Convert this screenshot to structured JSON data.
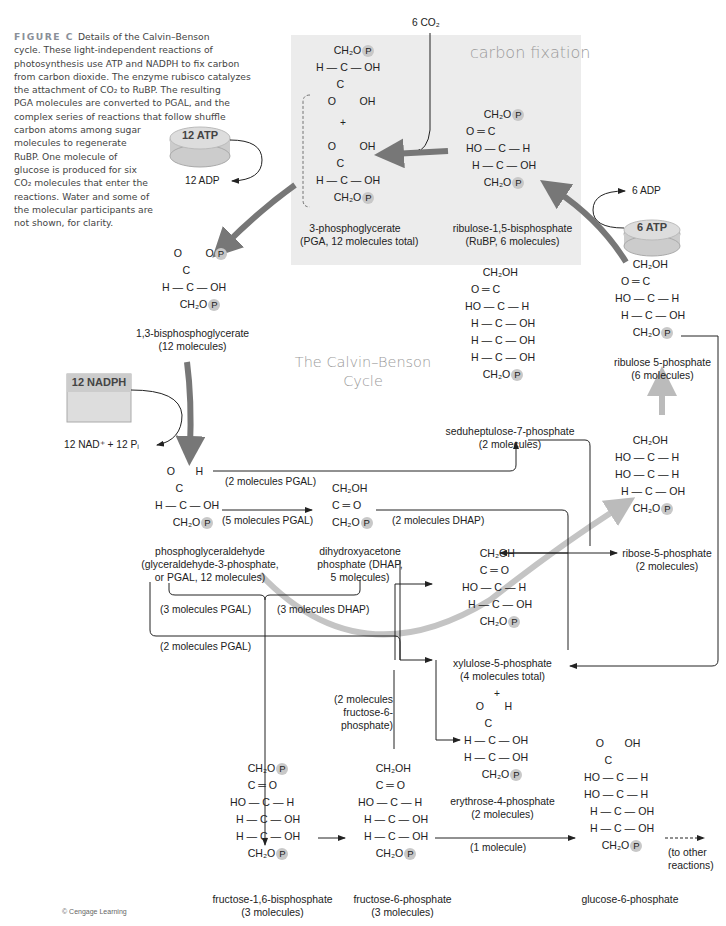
{
  "caption": {
    "figure_label": "FIGURE C",
    "lines": [
      "Details of the Calvin–Benson",
      "cycle. These light-independent reactions of",
      "photosynthesis use ATP and NADPH to fix carbon",
      "from carbon dioxide. The enzyme rubisco catalyzes",
      "the attachment of CO₂ to RuBP. The resulting",
      "PGA molecules are converted to PGAL, and the",
      "complex series of reactions that follow shuffle",
      "carbon atoms among sugar",
      "molecules to regenerate",
      "RuBP. One molecule of",
      "glucose is produced for six",
      "CO₂ molecules that enter the",
      "reactions. Water and some of",
      "the molecular participants are",
      "not shown, for clarity."
    ]
  },
  "titles": {
    "carbon_fixation": "carbon fixation",
    "cycle_line1": "The Calvin–Benson",
    "cycle_line2": "Cycle"
  },
  "inputs": {
    "co2": "6 CO₂",
    "atp12": "12 ATP",
    "adp12": "12 ADP",
    "nadph12": "12 NADPH",
    "nad_pi": "12 NAD⁺ + 12 Pᵢ",
    "atp6": "6 ATP",
    "adp6": "6 ADP"
  },
  "molecules": {
    "pga": {
      "name": "3-phosphoglycerate",
      "detail": "(PGA, 12 molecules total)"
    },
    "rubp": {
      "name": "ribulose-1,5-bisphosphate",
      "detail": "(RuBP, 6 molecules)"
    },
    "bpg": {
      "name": "1,3-bisphosphoglycerate",
      "detail": "(12 molecules)"
    },
    "pgal": {
      "name": "phosphoglyceraldehyde",
      "detail1": "(glyceraldehyde-3-phosphate,",
      "detail2": "or PGAL, 12 molecules)"
    },
    "dhap": {
      "name": "dihydroxyacetone",
      "detail1": "phosphate (DHAP,",
      "detail2": "5 molecules)"
    },
    "s7p": {
      "name": "seduheptulose-7-phosphate",
      "detail": "(2 molecules)"
    },
    "ru5p": {
      "name": "ribulose 5-phosphate",
      "detail": "(6 molecules)"
    },
    "r5p": {
      "name": "ribose-5-phosphate",
      "detail": "(2 molecules)"
    },
    "x5p": {
      "name": "xylulose-5-phosphate",
      "detail": "(4 molecules total)"
    },
    "e4p": {
      "name": "erythrose-4-phosphate",
      "detail": "(2 molecules)"
    },
    "fbp": {
      "name": "fructose-1,6-bisphosphate",
      "detail": "(3 molecules)"
    },
    "f6p": {
      "name": "fructose-6-phosphate",
      "detail": "(3 molecules)"
    },
    "g6p": {
      "name": "glucose-6-phosphate"
    }
  },
  "flow_labels": {
    "pgal2_top": "(2 molecules PGAL)",
    "pgal5": "(5 molecules PGAL)",
    "dhap2": "(2 molecules DHAP)",
    "pgal3": "(3 molecules PGAL)",
    "dhap3": "(3 molecules DHAP)",
    "pgal2_bottom": "(2 molecules PGAL)",
    "f6p2_l1": "(2 molecules",
    "f6p2_l2": "fructose-6-",
    "f6p2_l3": "phosphate)",
    "one_molecule": "(1 molecule)",
    "other_l1": "(to other",
    "other_l2": "reactions)",
    "plus": "+"
  },
  "chem": {
    "ch2op": "CH₂O",
    "ch2oh": "CH₂OH",
    "p": "P",
    "h_c_oh": "H — C — OH",
    "ho_c_h": "HO — C — H",
    "o_eq_c": "O ═ C",
    "c_eq_o": "C ═ O",
    "bond": "|"
  },
  "credit": "© Cengage Learning"
}
